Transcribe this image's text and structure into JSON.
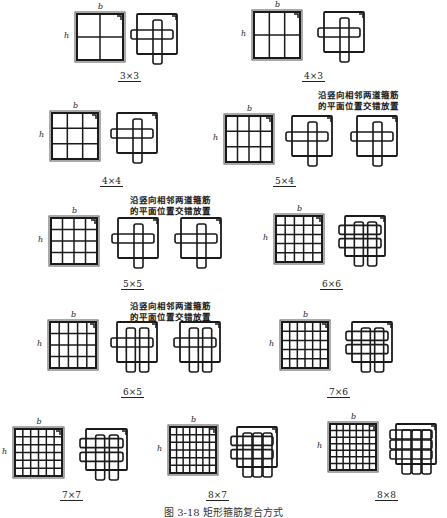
{
  "figure": {
    "caption": "图 3-18  矩形箍筋复合方式",
    "dim_width": "b",
    "dim_height": "h",
    "note_line1": "沿竖向相邻两道箍筋",
    "note_line2": "的平面位置交错放置"
  },
  "configurations": [
    {
      "id": "3x3",
      "label": "3×3",
      "cols": 3,
      "rows": 3,
      "detail_views": 1,
      "has_note": false
    },
    {
      "id": "4x3",
      "label": "4×3",
      "cols": 4,
      "rows": 3,
      "detail_views": 1,
      "has_note": false
    },
    {
      "id": "4x4",
      "label": "4×4",
      "cols": 4,
      "rows": 4,
      "detail_views": 1,
      "has_note": false
    },
    {
      "id": "5x4",
      "label": "5×4",
      "cols": 5,
      "rows": 4,
      "detail_views": 2,
      "has_note": true
    },
    {
      "id": "5x5",
      "label": "5×5",
      "cols": 5,
      "rows": 5,
      "detail_views": 2,
      "has_note": true
    },
    {
      "id": "6x6",
      "label": "6×6",
      "cols": 6,
      "rows": 6,
      "detail_views": 1,
      "has_note": false
    },
    {
      "id": "6x5",
      "label": "6×5",
      "cols": 6,
      "rows": 5,
      "detail_views": 2,
      "has_note": true
    },
    {
      "id": "7x6",
      "label": "7×6",
      "cols": 7,
      "rows": 6,
      "detail_views": 1,
      "has_note": false
    },
    {
      "id": "7x7",
      "label": "7×7",
      "cols": 7,
      "rows": 7,
      "detail_views": 1,
      "has_note": false
    },
    {
      "id": "8x7",
      "label": "8×7",
      "cols": 8,
      "rows": 7,
      "detail_views": 1,
      "has_note": false
    },
    {
      "id": "8x8",
      "label": "8×8",
      "cols": 8,
      "rows": 8,
      "detail_views": 1,
      "has_note": false
    }
  ],
  "colors": {
    "line": "#1a1a1a",
    "background": "#ffffff",
    "frame": "#555555"
  }
}
